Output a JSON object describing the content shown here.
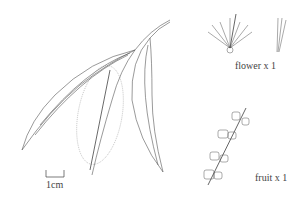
{
  "illustration": {
    "subject": "bottlebrush branch with leaves and flower spike",
    "labels": {
      "flower": "flower x 1",
      "fruit": "fruit x 1",
      "scale": "1cm"
    },
    "colors": {
      "line": "#555555",
      "background": "#ffffff"
    }
  }
}
